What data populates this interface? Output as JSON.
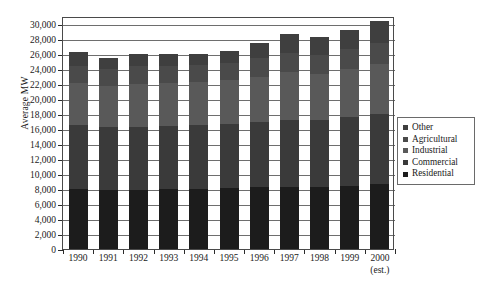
{
  "chart_data": {
    "type": "bar",
    "title": "",
    "subtitle": "",
    "xlabel": "",
    "ylabel": "Average MW",
    "stacked": true,
    "grid": true,
    "legend_position": "right",
    "ylim": [
      0,
      31000
    ],
    "ytick_step": 2000,
    "ytick_labels": [
      "0",
      "2,000",
      "4,000",
      "6,000",
      "8,000",
      "10,000",
      "12,000",
      "14,000",
      "16,000",
      "18,000",
      "20,000",
      "22,000",
      "24,000",
      "26,000",
      "28,000",
      "30,000"
    ],
    "ytick_values": [
      0,
      2000,
      4000,
      6000,
      8000,
      10000,
      12000,
      14000,
      16000,
      18000,
      20000,
      22000,
      24000,
      26000,
      28000,
      30000
    ],
    "categories": [
      "1990",
      "1991",
      "1992",
      "1993",
      "1994",
      "1995",
      "1996",
      "1997",
      "1998",
      "1999",
      "2000"
    ],
    "category_sublabels": [
      "",
      "",
      "",
      "",
      "",
      "",
      "",
      "",
      "",
      "",
      "(est.)"
    ],
    "series": [
      {
        "name": "Residential",
        "color": "#1c1c1c",
        "values": [
          8000,
          7900,
          7900,
          7950,
          8000,
          8100,
          8200,
          8300,
          8250,
          8400,
          8600
        ]
      },
      {
        "name": "Commercial",
        "color": "#3a3a3a",
        "values": [
          8450,
          8300,
          8400,
          8400,
          8450,
          8500,
          8700,
          8900,
          8850,
          9100,
          9300
        ]
      },
      {
        "name": "Industrial",
        "color": "#595959",
        "values": [
          5650,
          5500,
          5700,
          5700,
          5750,
          5900,
          6000,
          6300,
          6200,
          6400,
          6700
        ]
      },
      {
        "name": "Agricultural",
        "color": "#4a4a4a",
        "values": [
          2300,
          2200,
          2300,
          2300,
          2300,
          2300,
          2500,
          2600,
          2500,
          2700,
          2800
        ]
      },
      {
        "name": "Other",
        "color": "#3f3f3f",
        "values": [
          1800,
          1500,
          1600,
          1550,
          1500,
          1500,
          2000,
          2500,
          2400,
          2600,
          3000
        ]
      }
    ],
    "totals": [
      26200,
      25400,
      25900,
      25900,
      26000,
      26300,
      27400,
      28600,
      28200,
      29200,
      30400
    ]
  },
  "legend": {
    "items": [
      "Other",
      "Agricultural",
      "Industrial",
      "Commercial",
      "Residential"
    ]
  }
}
